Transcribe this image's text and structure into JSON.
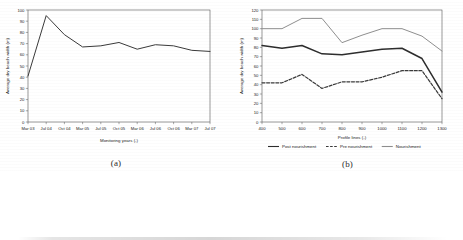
{
  "figure": {
    "panels": [
      {
        "id": "a",
        "caption": "(a)"
      },
      {
        "id": "b",
        "caption": "(b)"
      }
    ]
  },
  "chart_data": [
    {
      "panel": "a",
      "caption": "(a)",
      "type": "line",
      "title": "",
      "xlabel": "Monitoring years (-)",
      "ylabel": "Average dry beach width (m)",
      "categories": [
        "Mar 03",
        "Jul 04",
        "Oct 04",
        "Mar 05",
        "Jul 05",
        "Oct 05",
        "Mar 06",
        "Jul 06",
        "Oct 06",
        "Mar 07",
        "Jul 07"
      ],
      "xtick_labels": [
        "Mar 03",
        "Jul 04",
        "Oct 04",
        "Mar 05",
        "Jul 05",
        "Oct 05",
        "Mar 06",
        "Jul 06",
        "Oct 06",
        "Mar 07",
        "Jul 07"
      ],
      "ytick_labels": [
        "0",
        "10",
        "20",
        "30",
        "40",
        "50",
        "60",
        "70",
        "80",
        "90",
        "100"
      ],
      "yticks": [
        0,
        10,
        20,
        30,
        40,
        50,
        60,
        70,
        80,
        90,
        100
      ],
      "ylim": [
        0,
        100
      ],
      "grid": false,
      "legend": "none",
      "series": [
        {
          "name": "Average dry beach width",
          "color": "#3a3a3a",
          "style": "solid",
          "values": [
            41,
            95,
            78,
            67,
            68,
            71,
            65,
            69,
            68,
            64,
            63
          ]
        }
      ]
    },
    {
      "panel": "b",
      "caption": "(b)",
      "type": "line",
      "title": "",
      "xlabel": "Profile lines (-)",
      "ylabel": "Average dry beach width (m)",
      "x": [
        400,
        500,
        600,
        700,
        800,
        900,
        1000,
        1100,
        1200,
        1300
      ],
      "xtick_labels": [
        "400",
        "500",
        "600",
        "700",
        "800",
        "900",
        "1000",
        "1100",
        "1200",
        "1300"
      ],
      "ytick_labels": [
        "0",
        "10",
        "20",
        "30",
        "40",
        "50",
        "60",
        "70",
        "80",
        "90",
        "100",
        "110",
        "120"
      ],
      "yticks": [
        0,
        10,
        20,
        30,
        40,
        50,
        60,
        70,
        80,
        90,
        100,
        110,
        120
      ],
      "ylim": [
        0,
        120
      ],
      "grid": false,
      "legend": "bottom",
      "series": [
        {
          "name": "Post nourishment",
          "color": "#2d2d2d",
          "style": "solid",
          "width": 1.5,
          "values": [
            82,
            79,
            82,
            73,
            72,
            75,
            78,
            79,
            68,
            32
          ]
        },
        {
          "name": "Pre nourishment",
          "color": "#3a3a3a",
          "style": "dashed",
          "width": 1.2,
          "values": [
            42,
            42,
            51,
            36,
            43,
            43,
            48,
            55,
            55,
            25
          ]
        },
        {
          "name": "Nourishment",
          "color": "#8f8f8f",
          "style": "solid",
          "width": 1.0,
          "values": [
            100,
            100,
            111,
            111,
            85,
            93,
            100,
            100,
            92,
            76
          ]
        }
      ]
    }
  ],
  "legend": {
    "items": [
      {
        "label": "Post nourishment",
        "color": "#2d2d2d",
        "style": "solid"
      },
      {
        "label": "Pre nourishment",
        "color": "#3a3a3a",
        "style": "dashed"
      },
      {
        "label": "Nourishment",
        "color": "#8f8f8f",
        "style": "solid"
      }
    ]
  }
}
